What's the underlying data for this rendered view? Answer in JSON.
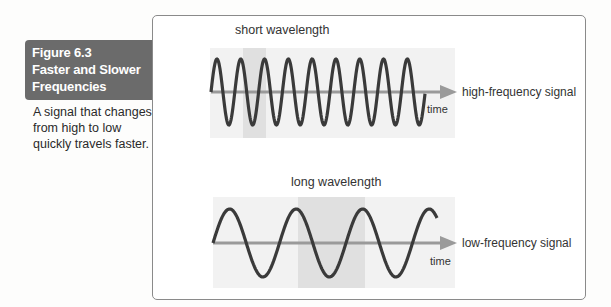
{
  "figure": {
    "number": "Figure 6.3",
    "title_line1": "Faster and Slower",
    "title_line2": "Frequencies",
    "caption": "A signal that changes from high to low quickly travels faster."
  },
  "diagrams": {
    "top": {
      "heading": "short wavelength",
      "axis_label": "time",
      "signal_label": "high-frequency signal",
      "cycles": 9
    },
    "bottom": {
      "heading": "long wavelength",
      "axis_label": "time",
      "signal_label": "low-frequency signal",
      "cycles": 3.5
    }
  },
  "colors": {
    "label_bg": "#6b6b6b",
    "wave": "#3a3a3a",
    "axis": "#9a9a9a",
    "shade_light": "#f1f1f1",
    "shade_dark": "#e0e0e0"
  }
}
